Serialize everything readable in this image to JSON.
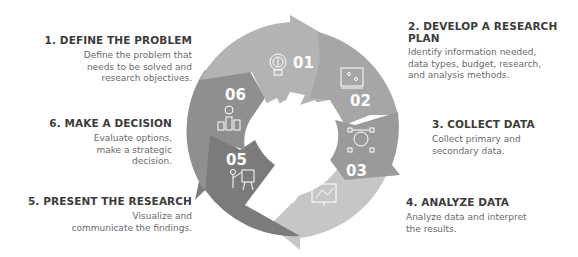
{
  "steps": [
    {
      "number": "01",
      "title": "1. DEFINE THE PROBLEM",
      "description": [
        "Define the problem that",
        "needs to be solved and",
        "research objectives."
      ],
      "icon": "lightbulb-icon",
      "color": "#b3b3b3"
    },
    {
      "number": "02",
      "title": "2. DEVELOP A RESEARCH",
      "title_line2": "PLAN",
      "description": [
        "Identify information needed,",
        "data types, budget, research,",
        "and analysis methods."
      ],
      "icon": "plan-map-icon",
      "color": "#a6a6a6"
    },
    {
      "number": "03",
      "title": "3. COLLECT DATA",
      "description": [
        "Collect primary and",
        "secondary data."
      ],
      "icon": "idea-network-icon",
      "color": "#9a9a9a"
    },
    {
      "number": "04",
      "title": "4. ANALYZE DATA",
      "description": [
        "Analyze data and interpret",
        "the results."
      ],
      "icon": "analytics-screen-icon",
      "color": "#c6c6c6"
    },
    {
      "number": "05",
      "title": "5. PRESENT THE RESEARCH",
      "description": [
        "Visualize and",
        "communicate the findings."
      ],
      "icon": "presenter-icon",
      "color": "#7b7b7b"
    },
    {
      "number": "06",
      "title": "6. MAKE A DECISION",
      "description": [
        "Evaluate options,",
        "make a strategic",
        "decision."
      ],
      "icon": "decision-podium-icon",
      "color": "#8f8f8f"
    }
  ]
}
